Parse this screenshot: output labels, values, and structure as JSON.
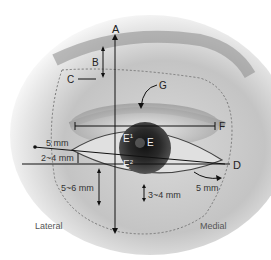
{
  "diagram": {
    "type": "eye-anatomy-annotation",
    "labels": {
      "A": "A",
      "B": "B",
      "C": "C",
      "D": "D",
      "E": "E",
      "E1": "E",
      "E1_sup": "1",
      "E2": "E",
      "E2_sup": "2",
      "F": "F",
      "G": "G"
    },
    "measurements": {
      "lateral_upper": "5 mm",
      "lateral_gap": "2~4 mm",
      "lower_lateral": "5~6 mm",
      "lower_center": "3~4 mm",
      "medial": "5 mm"
    },
    "sides": {
      "lateral": "Lateral",
      "medial": "Medial"
    }
  }
}
